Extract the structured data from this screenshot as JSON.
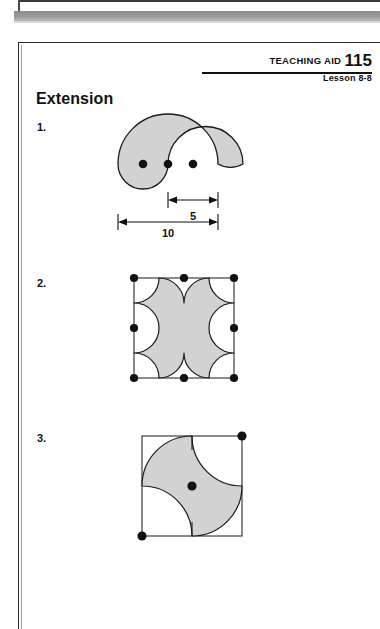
{
  "document": {
    "type": "worksheet-page",
    "header": {
      "teaching_aid_label": "TEACHING AID",
      "teaching_aid_number": "115",
      "lesson": "Lesson 8-8"
    },
    "section_title": "Extension"
  },
  "colors": {
    "ink": "#111111",
    "rule": "#2c2c2c",
    "figure_fill": "#d2d2d2",
    "figure_stroke": "#1a1a1a",
    "scan_band": "#9a9a9a"
  },
  "items": [
    {
      "number": "1.",
      "figure_name": "yin-yang-spiral-figure",
      "dimensions": [
        {
          "label": "5",
          "name": "dimension-5"
        },
        {
          "label": "10",
          "name": "dimension-10"
        }
      ],
      "dot_count": 3
    },
    {
      "number": "2.",
      "figure_name": "square-with-scalloped-arcs-figure",
      "dimensions": [],
      "dot_count": 8
    },
    {
      "number": "3.",
      "figure_name": "square-with-pinwheel-figure",
      "dimensions": [],
      "dot_count": 3
    }
  ]
}
